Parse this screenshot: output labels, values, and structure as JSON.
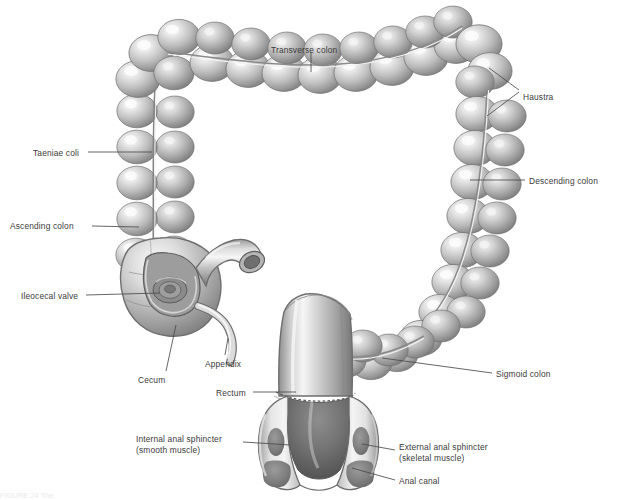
{
  "figure": {
    "background_color": "#ffffff",
    "label_color": "#3b3b3b",
    "leader_color": "#4a4a4a",
    "organ_colors": {
      "base": "#b9b9b9",
      "light": "#efefef",
      "highlight": "#fbfbfb",
      "mid": "#a8a8a8",
      "shadow": "#7c7c7c",
      "deep_shadow": "#5d5d5d",
      "outline": "#6e6e6e",
      "muscle": "#8a8a8a",
      "cavity": "#707070"
    }
  },
  "labels": [
    {
      "id": "transverse-colon",
      "text": "Transverse colon",
      "x": 271,
      "y": 45,
      "align": "left"
    },
    {
      "id": "haustra",
      "text": "Haustra",
      "x": 523,
      "y": 92,
      "align": "left"
    },
    {
      "id": "taeniae-coli",
      "text": "Taeniae coli",
      "x": 33,
      "y": 148,
      "align": "left"
    },
    {
      "id": "descending-colon",
      "text": "Descending colon",
      "x": 529,
      "y": 176,
      "align": "left"
    },
    {
      "id": "ascending-colon",
      "text": "Ascending colon",
      "x": 10,
      "y": 221,
      "align": "left"
    },
    {
      "id": "ileocecal-valve",
      "text": "Ileocecal valve",
      "x": 21,
      "y": 291,
      "align": "left"
    },
    {
      "id": "appendix",
      "text": "Appendix",
      "x": 205,
      "y": 359,
      "align": "left"
    },
    {
      "id": "cecum",
      "text": "Cecum",
      "x": 138,
      "y": 375,
      "align": "left"
    },
    {
      "id": "rectum",
      "text": "Rectum",
      "x": 216,
      "y": 388,
      "align": "left"
    },
    {
      "id": "sigmoid-colon",
      "text": "Sigmoid colon",
      "x": 496,
      "y": 369,
      "align": "left"
    },
    {
      "id": "anal-canal",
      "text": "Anal canal",
      "x": 399,
      "y": 476,
      "align": "left"
    }
  ],
  "multiline_labels": [
    {
      "id": "internal-anal-sphincter",
      "lines": [
        "Internal anal sphincter",
        "(smooth muscle)"
      ],
      "x": 136,
      "y": 434,
      "align": "left"
    },
    {
      "id": "external-anal-sphincter",
      "lines": [
        "External anal sphincter",
        "(skeletal muscle)"
      ],
      "x": 399,
      "y": 442,
      "align": "left"
    }
  ],
  "caption": {
    "text": "FIGURE 24  The",
    "visible": "partially cropped at page bottom"
  }
}
